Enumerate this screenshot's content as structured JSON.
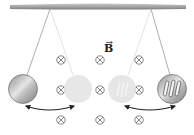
{
  "diagram": {
    "field_label": "B",
    "field_symbol": "into-page",
    "field_grid": {
      "columns_x": [
        61,
        100,
        139
      ],
      "rows_y": [
        60,
        90,
        120
      ]
    },
    "pendulums": [
      {
        "name": "solid-plate",
        "pivot": [
          50,
          9
        ],
        "positions": [
          {
            "x": 23,
            "y": 89,
            "state": "extreme",
            "opacity": 1
          },
          {
            "x": 78,
            "y": 89,
            "state": "ghost",
            "opacity": 0.35
          }
        ],
        "slotted": false
      },
      {
        "name": "slotted-plate",
        "pivot": [
          151,
          9
        ],
        "positions": [
          {
            "x": 172,
            "y": 89,
            "state": "extreme",
            "opacity": 1
          },
          {
            "x": 122,
            "y": 89,
            "state": "ghost",
            "opacity": 0.35
          }
        ],
        "slotted": true
      }
    ],
    "colors": {
      "ceiling": "#9a9a9a",
      "plate": "#a8a8a8",
      "string": "#777777",
      "symbol": "#666666",
      "arrow": "#222222"
    }
  }
}
